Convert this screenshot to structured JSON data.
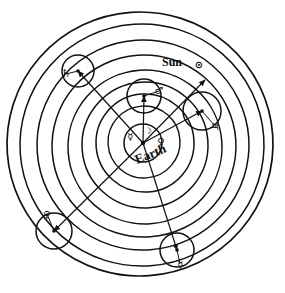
{
  "figure": {
    "kind": "astronomical-orbit-diagram",
    "system_name": "Tychonic system",
    "background_color": "#ffffff",
    "ink_color": "#111111",
    "width": 285,
    "height": 293
  },
  "labels": {
    "sun_label": "Sun",
    "sun_symbol": "⊙",
    "earth_label": "Earth",
    "earth_symbol": "⊕"
  },
  "center": {
    "cx": 143,
    "cy": 143,
    "earth_circle_radius": 19,
    "earth_label_x": 152,
    "earth_label_y": 158,
    "earth_label_rotation": -22,
    "earth_label_font_size": 13
  },
  "sun_marker": {
    "label_x": 172,
    "label_y": 66,
    "symbol_x": 199,
    "symbol_y": 68,
    "font_size": 12,
    "symbol_font_size": 10
  },
  "orbit_rings": [
    {
      "name": "outermost-sphere",
      "rx": 133,
      "ry": 132,
      "cx": 140,
      "cy": 144,
      "rotation": -4,
      "stroke_width": 1.7
    },
    {
      "name": "saturn-deferent-outer",
      "rx": 122,
      "ry": 121,
      "cx": 142,
      "cy": 145,
      "rotation": -4,
      "stroke_width": 1.5
    },
    {
      "name": "saturn-deferent",
      "rx": 106,
      "ry": 105,
      "cx": 143,
      "cy": 145,
      "rotation": -4,
      "stroke_width": 1.5
    },
    {
      "name": "jupiter-deferent",
      "rx": 92,
      "ry": 91,
      "cx": 144,
      "cy": 146,
      "rotation": -4,
      "stroke_width": 1.5
    },
    {
      "name": "mars-deferent",
      "rx": 77,
      "ry": 77,
      "cx": 145,
      "cy": 147,
      "rotation": -4,
      "stroke_width": 1.5
    },
    {
      "name": "sun-deferent",
      "rx": 63,
      "ry": 63,
      "cx": 145,
      "cy": 145,
      "rotation": -4,
      "stroke_width": 1.5
    },
    {
      "name": "venus-sphere",
      "rx": 49,
      "ry": 49,
      "cx": 145,
      "cy": 143,
      "rotation": -4,
      "stroke_width": 1.5
    },
    {
      "name": "mercury-sphere",
      "rx": 36,
      "ry": 36,
      "cx": 144,
      "cy": 142,
      "rotation": -4,
      "stroke_width": 1.4
    }
  ],
  "planets": [
    {
      "name": "saturn",
      "symbol": "♄",
      "epicycle_cx": 78,
      "epicycle_cy": 71,
      "epicycle_r": 16,
      "body_x": 66,
      "body_y": 74,
      "symbol_x": 66,
      "symbol_y": 77,
      "symbol_font_size": 11,
      "spoke_to": {
        "x": 143,
        "y": 143
      }
    },
    {
      "name": "jupiter",
      "symbol": "♃",
      "epicycle_cx": 202,
      "epicycle_cy": 111,
      "epicycle_r": 19,
      "body_x": 215,
      "body_y": 126,
      "symbol_x": 215,
      "symbol_y": 130,
      "symbol_font_size": 11,
      "spoke_to": {
        "x": 143,
        "y": 143
      }
    },
    {
      "name": "mars",
      "symbol": "♂",
      "epicycle_cx": 144,
      "epicycle_cy": 96,
      "epicycle_r": 17,
      "body_x": 159,
      "body_y": 91,
      "symbol_x": 159,
      "symbol_y": 94,
      "symbol_font_size": 10,
      "spoke_to": {
        "x": 143,
        "y": 143
      }
    },
    {
      "name": "venus",
      "symbol": "♀",
      "epicycle_cx": 54,
      "epicycle_cy": 231,
      "epicycle_r": 18,
      "body_x": 47,
      "body_y": 214,
      "symbol_x": 47,
      "symbol_y": 218,
      "symbol_font_size": 10,
      "spoke_to": {
        "x": 143,
        "y": 143
      }
    },
    {
      "name": "mercury",
      "symbol": "☿",
      "epicycle_cx": 177,
      "epicycle_cy": 250,
      "epicycle_r": 17,
      "body_x": 180,
      "body_y": 264,
      "symbol_x": 180,
      "symbol_y": 268,
      "symbol_font_size": 10,
      "spoke_to": {
        "x": 143,
        "y": 143
      }
    }
  ],
  "inner_bodies": [
    {
      "name": "mercury-inner",
      "symbol": "☿",
      "x": 130,
      "y": 140,
      "font_size": 10
    },
    {
      "name": "venus-inner",
      "symbol": "♀",
      "x": 161,
      "y": 145,
      "font_size": 10
    },
    {
      "name": "moon-node",
      "symbol": "☽",
      "x": 148,
      "y": 134,
      "font_size": 9
    }
  ],
  "spokes": [
    {
      "name": "spoke-to-saturn",
      "x1": 143,
      "y1": 143,
      "x2": 78,
      "y2": 71
    },
    {
      "name": "spoke-to-jupiter",
      "x1": 143,
      "y1": 143,
      "x2": 202,
      "y2": 111
    },
    {
      "name": "spoke-to-mars",
      "x1": 143,
      "y1": 143,
      "x2": 144,
      "y2": 96
    },
    {
      "name": "spoke-to-venus",
      "x1": 143,
      "y1": 143,
      "x2": 54,
      "y2": 231
    },
    {
      "name": "spoke-to-mercury",
      "x1": 143,
      "y1": 143,
      "x2": 177,
      "y2": 250
    },
    {
      "name": "spoke-to-sun",
      "x1": 143,
      "y1": 143,
      "x2": 205,
      "y2": 80
    }
  ]
}
